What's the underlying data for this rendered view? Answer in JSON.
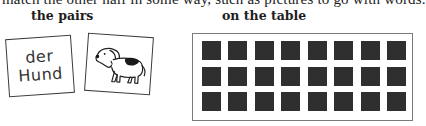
{
  "top_line": {
    "text": "match the other half in some way, such as pictures to go with words."
  },
  "headings": {
    "pairs": "the pairs",
    "table": "on the table"
  },
  "word_card": {
    "line1": "der",
    "line2": "Hund"
  },
  "picture_card": {
    "icon": "dog-icon"
  },
  "table": {
    "rows": 3,
    "columns": 8,
    "tile_color": "#2f2f2f",
    "frame_color": "#7a7a7a",
    "state": "face-down"
  }
}
